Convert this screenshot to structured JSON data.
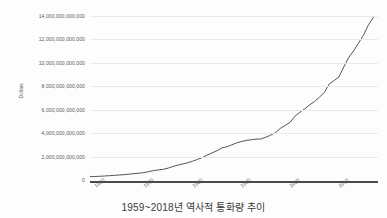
{
  "caption": "1959~2018년 역사적 통화량 추이",
  "chart_data": {
    "type": "line",
    "title": "",
    "xlabel": "",
    "ylabel": "Dollars",
    "xlim": [
      1959,
      2018
    ],
    "ylim": [
      0,
      14000000000000
    ],
    "grid": true,
    "legend": false,
    "line_color": "#55555a",
    "series": [
      {
        "name": "Money Supply",
        "x": [
          1959,
          1960,
          1961,
          1962,
          1963,
          1964,
          1965,
          1966,
          1967,
          1968,
          1969,
          1970,
          1971,
          1972,
          1973,
          1974,
          1975,
          1976,
          1977,
          1978,
          1979,
          1980,
          1981,
          1982,
          1983,
          1984,
          1985,
          1986,
          1987,
          1988,
          1989,
          1990,
          1991,
          1992,
          1993,
          1994,
          1995,
          1996,
          1997,
          1998,
          1999,
          2000,
          2001,
          2002,
          2003,
          2004,
          2005,
          2006,
          2007,
          2008,
          2009,
          2010,
          2011,
          2012,
          2013,
          2014,
          2015,
          2016,
          2017,
          2018
        ],
        "values": [
          286000000000,
          298000000000,
          318000000000,
          343000000000,
          369000000000,
          397000000000,
          428000000000,
          456000000000,
          498000000000,
          543000000000,
          580000000000,
          628000000000,
          711000000000,
          802000000000,
          861000000000,
          908000000000,
          1016000000000,
          1152000000000,
          1271000000000,
          1367000000000,
          1474000000000,
          1600000000000,
          1756000000000,
          1911000000000,
          2127000000000,
          2311000000000,
          2497000000000,
          2734000000000,
          2832000000000,
          2995000000000,
          3159000000000,
          3279000000000,
          3379000000000,
          3434000000000,
          3487000000000,
          3502000000000,
          3649000000000,
          3824000000000,
          4046000000000,
          4404000000000,
          4664000000000,
          4932000000000,
          5448000000000,
          5786000000000,
          6071000000000,
          6421000000000,
          6691000000000,
          7070000000000,
          7471000000000,
          8190000000000,
          8487000000000,
          8799000000000,
          9658000000000,
          10452000000000,
          11024000000000,
          11679000000000,
          12339000000000,
          13215000000000,
          13846000000000,
          14400000000000
        ]
      }
    ],
    "y_ticks": [
      {
        "value": 0,
        "label": "0"
      },
      {
        "value": 2000000000000,
        "label": "2,000,000,000,000"
      },
      {
        "value": 4000000000000,
        "label": "4,000,000,000,000"
      },
      {
        "value": 6000000000000,
        "label": "6,000,000,000,000"
      },
      {
        "value": 8000000000000,
        "label": "8,000,000,000,000"
      },
      {
        "value": 10000000000000,
        "label": "10,000,000,000,000"
      },
      {
        "value": 12000000000000,
        "label": "12,000,000,000,000"
      },
      {
        "value": 14000000000000,
        "label": "14,000,000,000,000"
      }
    ],
    "x_ticks": [
      {
        "value": 1960,
        "label": "1960"
      },
      {
        "value": 1970,
        "label": "1970"
      },
      {
        "value": 1980,
        "label": "1980"
      },
      {
        "value": 1990,
        "label": "1990"
      },
      {
        "value": 2000,
        "label": "2000"
      },
      {
        "value": 2010,
        "label": "2010"
      }
    ]
  }
}
